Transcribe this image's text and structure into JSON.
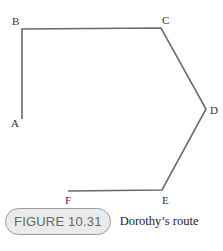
{
  "figure": {
    "label": "FIGURE 10.31",
    "title": "Dorothy’s route"
  },
  "route": {
    "points": [
      {
        "name": "A",
        "x": 22,
        "y": 119,
        "lx": 11,
        "ly": 127
      },
      {
        "name": "B",
        "x": 22,
        "y": 29,
        "lx": 12,
        "ly": 25
      },
      {
        "name": "C",
        "x": 161,
        "y": 28,
        "lx": 162,
        "ly": 24
      },
      {
        "name": "D",
        "x": 206,
        "y": 109,
        "lx": 210,
        "ly": 114
      },
      {
        "name": "E",
        "x": 162,
        "y": 190,
        "lx": 162,
        "ly": 204
      },
      {
        "name": "F",
        "x": 68,
        "y": 191,
        "lx": 65,
        "ly": 204
      }
    ],
    "line_color": "#6b6b6b"
  }
}
